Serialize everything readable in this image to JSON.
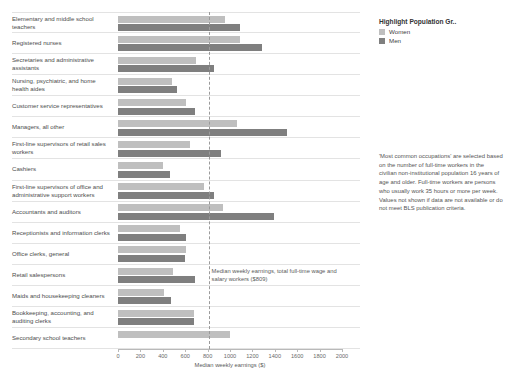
{
  "legend": {
    "title": "Highlight Population Gr..",
    "items": [
      {
        "label": "Women",
        "color": "#bfbfbf"
      },
      {
        "label": "Men",
        "color": "#7f7f7f"
      }
    ]
  },
  "side_note": "'Most common occupations' are selected based on the number of full-time workers in the civilian non-institutional population 16 years of age and older. Full-time workers are persons who usually work 35 hours or more per week. Values not shown if data are not available or do not meet BLS publication criteria.",
  "median_annotation": "Median weekly earnings, total full-time wage and salary workers ($809)",
  "chart_data": {
    "type": "bar",
    "orientation": "horizontal",
    "title": "",
    "xlabel": "Median weekly earnings ($)",
    "ylabel": "",
    "xlim": [
      0,
      2000
    ],
    "xticks": [
      0,
      200,
      400,
      600,
      800,
      1000,
      1200,
      1400,
      1600,
      1800,
      2000
    ],
    "grid": false,
    "legend_position": "right",
    "reference_line": {
      "value": 809,
      "label": "Median weekly earnings, total full-time wage and salary workers ($809)",
      "style": "dashed"
    },
    "categories": [
      "Elementary and middle school teachers",
      "Registered nurses",
      "Secretaries and administrative assistants",
      "Nursing, psychiatric, and home health aides",
      "Customer service representatives",
      "Managers, all other",
      "First-line supervisors of retail sales workers",
      "Cashiers",
      "First-line supervisors of office and administrative support workers",
      "Accountants and auditors",
      "Receptionists and information clerks",
      "Office clerks, general",
      "Retail salespersons",
      "Maids and housekeeping cleaners",
      "Bookkeeping, accounting, and auditing clerks",
      "Secondary school teachers"
    ],
    "series": [
      {
        "name": "Women",
        "color": "#bfbfbf",
        "values": [
          955,
          1090,
          700,
          480,
          610,
          1060,
          640,
          400,
          770,
          940,
          550,
          610,
          490,
          410,
          680,
          1000
        ]
      },
      {
        "name": "Men",
        "color": "#7f7f7f",
        "values": [
          1090,
          1290,
          860,
          530,
          690,
          1510,
          920,
          460,
          860,
          1390,
          610,
          600,
          690,
          470,
          680,
          null
        ]
      }
    ]
  }
}
